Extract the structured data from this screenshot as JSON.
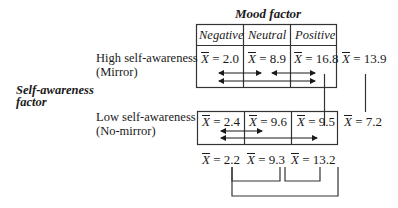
{
  "title": "Mood factor",
  "row_factor_label": "Self-awareness factor",
  "row_factor_lines": [
    "Self-awareness",
    "factor"
  ],
  "columns": [
    "Negative",
    "Neutral",
    "Positive"
  ],
  "rows": [
    {
      "label_line1": "High self-awareness",
      "label_line2": "(Mirror)",
      "means": [
        "2.0",
        "8.9",
        "16.8"
      ],
      "row_mean": "13.9"
    },
    {
      "label_line1": "Low self-awareness",
      "label_line2": "(No-mirror)",
      "means": [
        "2.4",
        "9.6",
        "9.5"
      ],
      "row_mean": "7.2"
    }
  ],
  "column_means": [
    "2.2",
    "9.3",
    "13.2"
  ],
  "mean_symbol": "X",
  "equals": "="
}
